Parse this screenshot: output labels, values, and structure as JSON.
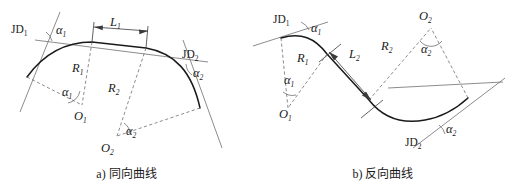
{
  "figure": {
    "background_color": "#ffffff",
    "curve_color": "#1a1a1a",
    "auxiliary_color": "#6e6e72"
  },
  "panel_a": {
    "caption": "a) 同向曲线",
    "labels": {
      "jd1": "JD",
      "jd1_sub": "1",
      "jd2": "JD",
      "jd2_sub": "2",
      "alpha1_top": "α",
      "alpha1_top_sub": "1",
      "alpha1_center": "α",
      "alpha1_center_sub": "1",
      "alpha2_right": "α",
      "alpha2_right_sub": "2",
      "alpha2_center": "α",
      "alpha2_center_sub": "2",
      "r1": "R",
      "r1_sub": "1",
      "r2": "R",
      "r2_sub": "2",
      "o1": "O",
      "o1_sub": "1",
      "o2": "O",
      "o2_sub": "2",
      "l1": "L",
      "l1_sub": "1"
    }
  },
  "panel_b": {
    "caption": "b) 反向曲线",
    "labels": {
      "jd1": "JD",
      "jd1_sub": "1",
      "jd2": "JD",
      "jd2_sub": "2",
      "alpha1_top": "α",
      "alpha1_top_sub": "1",
      "alpha1_center": "α",
      "alpha1_center_sub": "1",
      "alpha2_top": "α",
      "alpha2_top_sub": "2",
      "alpha2_bottom": "α",
      "alpha2_bottom_sub": "2",
      "r1": "R",
      "r1_sub": "1",
      "r2": "R",
      "r2_sub": "2",
      "o1": "O",
      "o1_sub": "1",
      "o2": "O",
      "o2_sub": "2",
      "l2": "L",
      "l2_sub": "2"
    }
  }
}
